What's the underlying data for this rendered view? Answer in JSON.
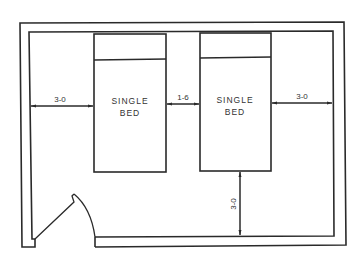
{
  "diagram": {
    "type": "floor-plan",
    "colors": {
      "line": "#2a2a2a",
      "text": "#333333",
      "background": "#ffffff"
    },
    "beds": [
      {
        "label_line1": "SINGLE",
        "label_line2": "BED"
      },
      {
        "label_line1": "SINGLE",
        "label_line2": "BED"
      }
    ],
    "dimensions": {
      "left_wall_to_bed1": "3-0",
      "between_beds": "1-6",
      "bed2_to_right_wall": "3-0",
      "bed2_to_bottom_wall": "3-0"
    }
  }
}
